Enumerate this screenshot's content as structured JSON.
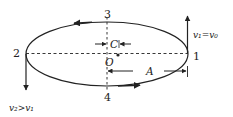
{
  "diagram": {
    "type": "elliptical-orbit",
    "points": {
      "p1": "1",
      "p2": "2",
      "p3": "3",
      "p4": "4"
    },
    "center_label": "O",
    "focal_distance_label": "C",
    "semi_major_label": "A",
    "velocity_at_1": "v₁=v₀",
    "velocity_at_2": "v₂>v₁",
    "colors": {
      "line": "#222222",
      "background": "#ffffff"
    }
  }
}
